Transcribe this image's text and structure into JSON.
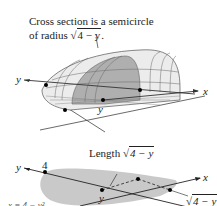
{
  "top_figure": {
    "caption_line1": "Cross section is a semicircle",
    "caption_line2_prefix": "of radius ",
    "caption_radical": "4 − y",
    "caption_suffix": ".",
    "axis_y_label": "y",
    "axis_x_label": "x",
    "point_label_y": "y",
    "colors": {
      "solid_fill": "#e9e9e9",
      "cross_section": "#a7a7a7",
      "lines": "#444444"
    }
  },
  "bottom_figure": {
    "length_prefix": "Length ",
    "length_radical": "4 − y",
    "axis_y_label": "y",
    "axis_x_label": "x",
    "tick_4": "4",
    "point_label_y": "y",
    "side_radical": "4 − y",
    "curve_label": "x = 4 − y²",
    "colors": {
      "region_fill": "#c9c9c9"
    }
  }
}
